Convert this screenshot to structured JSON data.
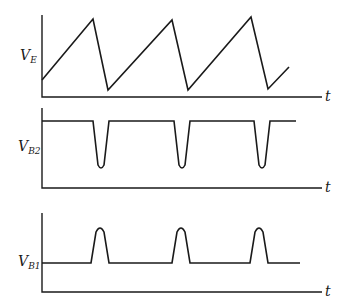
{
  "diagram": {
    "type": "waveform-timing-diagram",
    "panels": [
      {
        "id": "ve",
        "label_main": "V",
        "label_sub": "E",
        "time_label": "t",
        "shape": "sawtooth",
        "points": [
          [
            42,
            80
          ],
          [
            93,
            19
          ],
          [
            108,
            90
          ],
          [
            172,
            20
          ],
          [
            188,
            90
          ],
          [
            251,
            17
          ],
          [
            268,
            89
          ],
          [
            289,
            67
          ]
        ]
      },
      {
        "id": "vb2",
        "label_main": "V",
        "label_sub": "B2",
        "time_label": "t",
        "shape": "negative-pulse-train",
        "high_level_y": 121,
        "dip_y": 171,
        "dips_x": [
          [
            93,
            109
          ],
          [
            174,
            190
          ],
          [
            254,
            270
          ]
        ],
        "end_x": 296
      },
      {
        "id": "vb1",
        "label_main": "V",
        "label_sub": "B1",
        "time_label": "t",
        "shape": "positive-pulse-train",
        "base_level_y": 263,
        "peak_y": 226,
        "pulses_x": [
          [
            91,
            109
          ],
          [
            172,
            190
          ],
          [
            250,
            268
          ]
        ],
        "end_x": 300
      }
    ]
  }
}
